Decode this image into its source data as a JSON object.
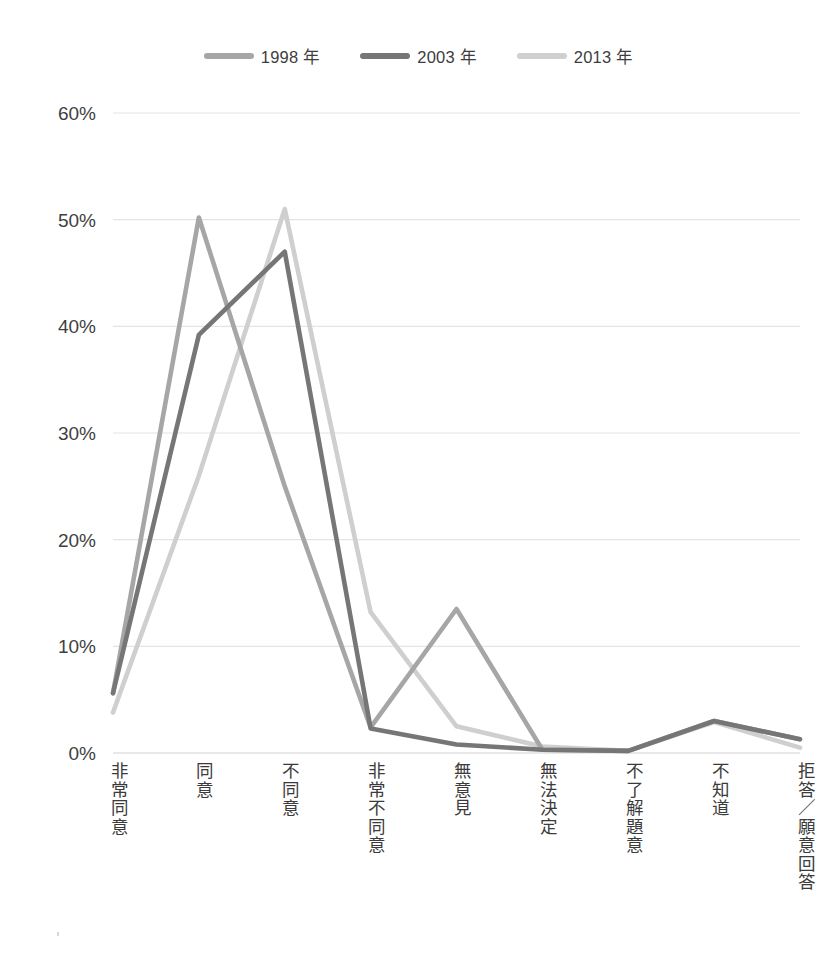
{
  "title": {
    "text": "",
    "note": "title row cropped off at top of screenshot"
  },
  "legend": {
    "position": "top-center",
    "items": [
      {
        "label": "1998 年",
        "color": "#a6a6a6"
      },
      {
        "label": "2003 年",
        "color": "#767676"
      },
      {
        "label": "2013 年",
        "color": "#cfcfcf"
      }
    ]
  },
  "axis": {
    "y_ticks": [
      "0%",
      "10%",
      "20%",
      "30%",
      "40%",
      "50%",
      "60%"
    ],
    "x_categories": [
      "非常同意",
      "同意",
      "不同意",
      "非常不同意",
      "無意見",
      "無法決定",
      "不了解題意",
      "不知道",
      "拒答／願意回答"
    ]
  },
  "chart_data": {
    "type": "line",
    "title": "",
    "xlabel": "",
    "ylabel": "",
    "ylim": [
      0,
      60
    ],
    "ytick_step": 10,
    "grid": true,
    "legend_position": "top-center",
    "value_unit": "%",
    "categories": [
      "非常同意",
      "同意",
      "不同意",
      "非常不同意",
      "無意見",
      "無法決定",
      "不了解題意",
      "不知道",
      "拒答／願意回答"
    ],
    "series": [
      {
        "name": "1998 年",
        "color": "#a6a6a6",
        "values": [
          5.6,
          50.2,
          25.0,
          2.4,
          13.5,
          0.3,
          0.2,
          3.0,
          1.3
        ]
      },
      {
        "name": "2003 年",
        "color": "#767676",
        "values": [
          5.6,
          39.2,
          47.0,
          2.3,
          0.8,
          0.3,
          0.2,
          3.0,
          1.3
        ]
      },
      {
        "name": "2013 年",
        "color": "#cfcfcf",
        "values": [
          3.8,
          26.0,
          51.0,
          13.2,
          2.5,
          0.6,
          0.2,
          2.9,
          0.5
        ]
      }
    ]
  }
}
